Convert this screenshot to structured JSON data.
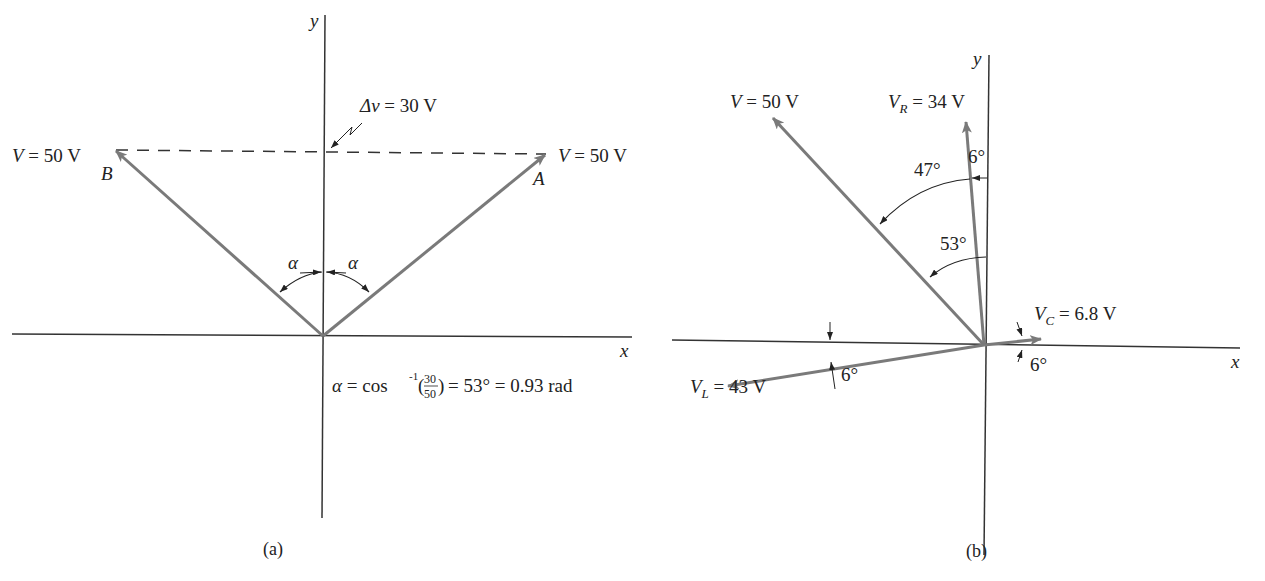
{
  "figure": {
    "panel_a": {
      "caption": "(a)",
      "axis_x_label": "x",
      "axis_y_label": "y",
      "vector_B": {
        "name": "B",
        "magnitude_label_var": "V",
        "magnitude_label_val": "= 50 V"
      },
      "vector_A": {
        "name": "A",
        "magnitude_label_var": "V",
        "magnitude_label_val": "= 50 V"
      },
      "delta_label_var": "Δv",
      "delta_label_val": "= 30 V",
      "angle_left": "α",
      "angle_right": "α",
      "formula": {
        "alpha": "α",
        "eq1": "= cos",
        "sup": "-1",
        "frac_num": "30",
        "frac_den": "50",
        "rest": "= 53° = 0.93 rad"
      }
    },
    "panel_b": {
      "caption": "(b)",
      "axis_x_label": "x",
      "axis_y_label": "y",
      "vector_V": {
        "var": "V",
        "value": "= 50 V"
      },
      "vector_VR": {
        "var": "V",
        "sub": "R",
        "value": "= 34 V"
      },
      "vector_VC": {
        "var": "V",
        "sub": "C",
        "value": "= 6.8 V"
      },
      "vector_VL": {
        "var": "V",
        "sub": "L",
        "value": "= 43 V"
      },
      "angle_VR_y": "6°",
      "angle_47": "47°",
      "angle_53": "53°",
      "angle_VC_x": "6°",
      "angle_VL_x": "6°"
    },
    "colors": {
      "vector": "#7a7a7a",
      "axis": "#333333",
      "text": "#222222",
      "background": "#ffffff"
    }
  }
}
